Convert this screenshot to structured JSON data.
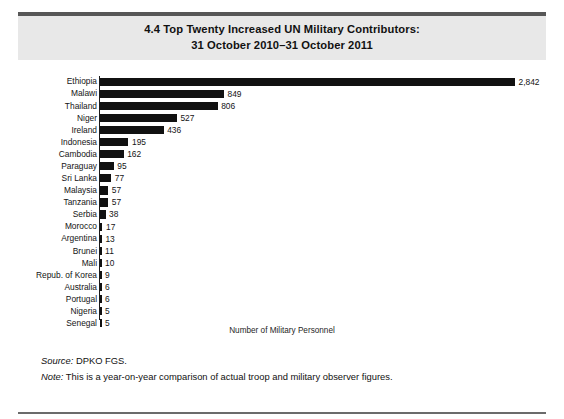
{
  "figure": {
    "band_title_line1": "4.4  Top Twenty Increased UN Military Contributors:",
    "band_title_line2": "31 October 2010–31 October 2011",
    "source_lead": "Source:",
    "source_text": " DPKO FGS.",
    "note_lead": "Note:",
    "note_text": " This is a year-on-year comparison of actual troop and military observer figures.",
    "colors": {
      "band_background": "#e8e8e8",
      "band_rule": "#575757",
      "bar": "#111111",
      "axis": "#1a1a1a",
      "bottom_rule": "#6b6b6b"
    }
  },
  "chart_data": {
    "type": "bar",
    "orientation": "horizontal",
    "title": "4.4  Top Twenty Increased UN Military Contributors: 31 October 2010–31 October 2011",
    "xlabel": "Number of Military Personnel",
    "ylabel": "",
    "grid": false,
    "legend": false,
    "xlim": [
      0,
      2842
    ],
    "axis_ticks_shown": false,
    "value_labels": true,
    "categories": [
      "Ethiopia",
      "Malawi",
      "Thailand",
      "Niger",
      "Ireland",
      "Indonesia",
      "Cambodia",
      "Paraguay",
      "Sri Lanka",
      "Malaysia",
      "Tanzania",
      "Serbia",
      "Morocco",
      "Argentina",
      "Brunei",
      "Mali",
      "Repub. of Korea",
      "Australia",
      "Portugal",
      "Nigeria",
      "Senegal"
    ],
    "values": [
      2842,
      849,
      806,
      527,
      436,
      195,
      162,
      95,
      77,
      57,
      57,
      38,
      17,
      13,
      11,
      10,
      9,
      6,
      6,
      5,
      5
    ],
    "value_labels_text": [
      "2,842",
      "849",
      "806",
      "527",
      "436",
      "195",
      "162",
      "95",
      "77",
      "57",
      "57",
      "38",
      "17",
      "13",
      "11",
      "10",
      "9",
      "6",
      "6",
      "5",
      "5"
    ]
  }
}
